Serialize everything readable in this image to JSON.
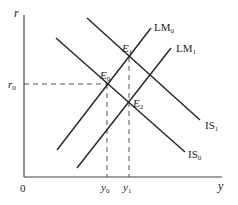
{
  "diagram": {
    "type": "IS-LM shift diagram",
    "axes": {
      "y_axis_label": "r",
      "x_axis_label": "y",
      "origin_label": "0"
    },
    "curves": [
      {
        "id": "IS0",
        "label_base": "IS",
        "label_sub": "0"
      },
      {
        "id": "IS1",
        "label_base": "IS",
        "label_sub": "1"
      },
      {
        "id": "LM0",
        "label_base": "LM",
        "label_sub": "0"
      },
      {
        "id": "LM1",
        "label_base": "LM",
        "label_sub": "1"
      }
    ],
    "points": [
      {
        "id": "E0",
        "label_base": "E",
        "label_sub": "0"
      },
      {
        "id": "E1",
        "label_base": "E",
        "label_sub": "1"
      },
      {
        "id": "E2",
        "label_base": "E",
        "label_sub": "2"
      }
    ],
    "ticks": {
      "r0": {
        "base": "r",
        "sub": "0"
      },
      "y0": {
        "base": "y",
        "sub": "0"
      },
      "y1": {
        "base": "y",
        "sub": "1"
      }
    },
    "colors": {
      "line": "#222222",
      "axis": "#444444",
      "dash": "#555555"
    }
  }
}
